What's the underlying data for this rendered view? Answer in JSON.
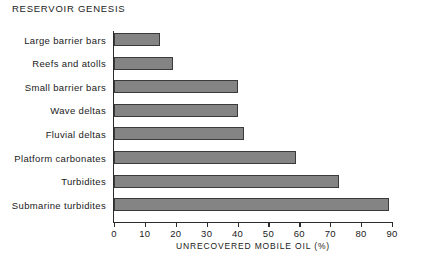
{
  "chart_data": {
    "type": "bar",
    "orientation": "horizontal",
    "title": "RESERVOIR GENESIS",
    "xlabel": "UNRECOVERED MOBILE OIL (%)",
    "ylabel": "",
    "xlim": [
      0,
      90
    ],
    "xticks": [
      0,
      10,
      20,
      30,
      40,
      50,
      60,
      70,
      80,
      90
    ],
    "xtick_labels": [
      "0",
      "10",
      "20",
      "30",
      "40",
      "50",
      "60",
      "70",
      "80",
      "90"
    ],
    "grid": false,
    "legend": false,
    "categories": [
      "Large barrier bars",
      "Reefs and atolls",
      "Small barrier bars",
      "Wave deltas",
      "Fluvial deltas",
      "Platform carbonates",
      "Turbidites",
      "Submarine turbidites"
    ],
    "values": [
      15,
      19,
      40,
      40,
      42,
      59,
      73,
      89
    ],
    "series": [
      {
        "name": "Unrecovered mobile oil",
        "values": [
          15,
          19,
          40,
          40,
          42,
          59,
          73,
          89
        ]
      }
    ],
    "bar_fill_color": "#848484",
    "bar_edge_color": "#3a3a3a",
    "axis_color": "#2b2b2b",
    "background_color": "#ffffff"
  }
}
